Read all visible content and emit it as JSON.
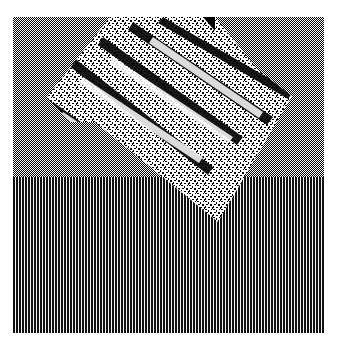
{
  "image": {
    "description": "Abstract 1-bit dithered image: a rotated, noise-textured square over a checkerboard upper region and vertical-stripe lower region",
    "colors": {
      "background": "#ffffff",
      "ink": "#000000",
      "stripe_dark": "#111111",
      "stripe_light": "#f4f4f4"
    },
    "regions": [
      {
        "name": "checkerboard-region",
        "pattern": "1px checkerboard"
      },
      {
        "name": "vertical-stripe-region",
        "pattern": "3px period vertical stripes"
      },
      {
        "name": "rotated-noise-square",
        "pattern": "random black/white noise with diagonal dark streaks"
      }
    ]
  }
}
